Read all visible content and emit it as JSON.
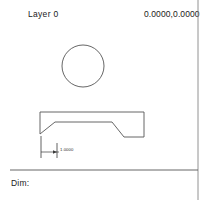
{
  "window": {
    "title": "CAD Drawing Canvas"
  },
  "header": {
    "layer_label": "Layer  0",
    "coordinates": "0.0000,0.0000"
  },
  "status_bar": {
    "prompt_label": "Dim:"
  },
  "drawing": {
    "dimension_label": "1.0000",
    "stroke_color": "#555555",
    "accent_color": "#1a1a1a",
    "background_color": "#ffffff",
    "entities": {
      "circle": {
        "name": "circle",
        "center_x": 83,
        "center_y": 66,
        "radius": 21
      },
      "polyline": {
        "name": "profile-outline",
        "points": "40,112 144,112 144,137 124,137 112,122 55,122 40,134 40,112"
      },
      "dimension": {
        "name": "linear-dimension",
        "extension_left_x": 41,
        "extension_right_x": 57,
        "extension_top_y": 136,
        "extension_bottom_y": 158,
        "dim_line_y": 152
      },
      "separator": {
        "name": "status-separator",
        "x1": 10,
        "y1": 170,
        "x2": 198,
        "y2": 170
      },
      "right_border": {
        "name": "panel-divider",
        "x": 198,
        "y1": 0,
        "y2": 200
      }
    }
  }
}
